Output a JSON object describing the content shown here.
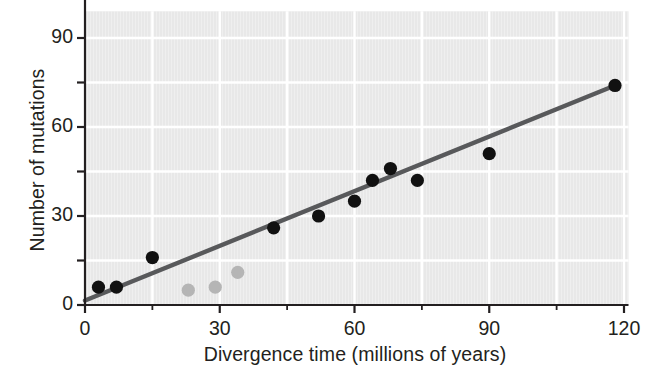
{
  "chart_data": {
    "type": "scatter",
    "title": "",
    "xlabel": "Divergence time (millions of years)",
    "ylabel": "Number of mutations",
    "xlim": [
      0,
      121
    ],
    "ylim": [
      0,
      99
    ],
    "xticks": [
      0,
      30,
      60,
      90,
      120
    ],
    "xtick_labels": [
      "0",
      "30",
      "60",
      "90",
      "120"
    ],
    "xminor_ticks": [
      15,
      45,
      75,
      105
    ],
    "yticks": [
      0,
      30,
      60,
      90
    ],
    "ytick_labels": [
      "0",
      "30",
      "60",
      "90"
    ],
    "yminor_ticks": [
      15,
      45,
      75
    ],
    "grid": true,
    "grid_color": "#ffffff",
    "plot_background": "#e8e8e8",
    "legend": null,
    "series": [
      {
        "name": "Primate comparisons",
        "marker": "circle",
        "color": "#111111",
        "points": [
          {
            "x": 3,
            "y": 6
          },
          {
            "x": 7,
            "y": 6
          },
          {
            "x": 15,
            "y": 16
          },
          {
            "x": 42,
            "y": 26
          },
          {
            "x": 52,
            "y": 30
          },
          {
            "x": 60,
            "y": 35
          },
          {
            "x": 64,
            "y": 42
          },
          {
            "x": 68,
            "y": 46
          },
          {
            "x": 74,
            "y": 42
          },
          {
            "x": 90,
            "y": 51
          },
          {
            "x": 118,
            "y": 74
          }
        ]
      },
      {
        "name": "Outlier comparisons",
        "marker": "circle",
        "color": "#b5b5b5",
        "points": [
          {
            "x": 23,
            "y": 5
          },
          {
            "x": 29,
            "y": 6
          },
          {
            "x": 34,
            "y": 11
          }
        ]
      }
    ],
    "trendline": {
      "name": "Best-fit line",
      "color": "#58595b",
      "x_start": 0,
      "y_start": 1.5,
      "x_end": 118,
      "y_end": 74,
      "slope": 0.614,
      "intercept": 1.5
    },
    "axis_color": "#231f20"
  }
}
